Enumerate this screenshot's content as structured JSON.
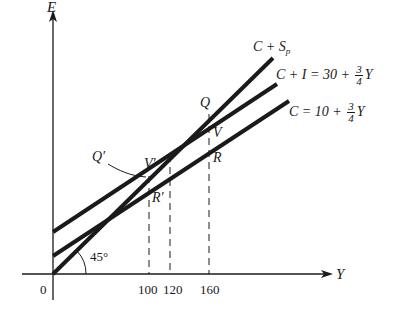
{
  "axes": {
    "y_axis_label": "E",
    "x_axis_label": "Y",
    "origin_label": "0",
    "angle_label": "45°",
    "x_ticks": [
      "100",
      "120",
      "160"
    ]
  },
  "lines": {
    "savings_line": {
      "prefix": "C + ",
      "s": "S",
      "sub": "p"
    },
    "aggregate_demand": {
      "lhs": "C + I = 30 + ",
      "num": "3",
      "den": "4",
      "var": "Y"
    },
    "consumption": {
      "lhs": "C = 10 + ",
      "num": "3",
      "den": "4",
      "var": "Y"
    }
  },
  "points": {
    "Q": "Q",
    "V": "V",
    "R": "R",
    "Q_prime": "Q′",
    "V_prime": "V′",
    "R_prime": "R′"
  },
  "colors": {
    "ink": "#1a1a1a",
    "background": "#ffffff"
  }
}
